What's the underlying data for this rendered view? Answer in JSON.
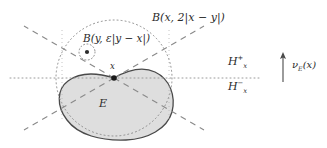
{
  "figure": {
    "title_label": "B(x, 2|x − y|)",
    "inner_ball_label": "B(y, ε|y − x|)",
    "halfspace_upper": "H",
    "halfspace_upper_sub": "x",
    "halfspace_upper_sup": "+",
    "halfspace_lower": "H",
    "halfspace_lower_sub": "x",
    "halfspace_lower_sup": "−",
    "normal_vector_label": "ν",
    "normal_vector_sub": "E",
    "normal_vector_arg": "(x)",
    "point_x_label": "x",
    "set_label": "E",
    "colors": {
      "ink": "#2b2b2b",
      "set_fill": "#dedede",
      "set_stroke": "#4a4a4a",
      "dotted": "#7a7a7a",
      "dashed": "#8a8a8a",
      "axis": "#9a9a9a"
    }
  },
  "geometry": {
    "point_x": [
      114,
      78
    ],
    "point_y": [
      87,
      52
    ],
    "outer_ball_radius": 58,
    "inner_ball_radius": 8,
    "horizontal_line_y": 78,
    "horizontal_line_x_start": 10,
    "horizontal_line_x_end": 260,
    "cone_angles_deg": [
      150,
      210,
      330,
      30
    ]
  }
}
